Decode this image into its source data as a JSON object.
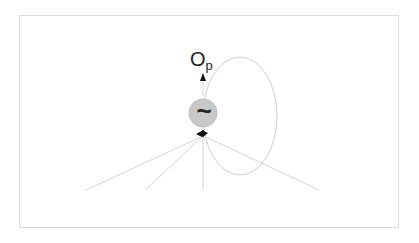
{
  "diagram": {
    "title": "",
    "output_label": "O",
    "output_subscript": "p",
    "node_symbol": "~",
    "node": {
      "cx": 203,
      "cy": 113,
      "r": 14,
      "fill": "#c8c8c8"
    },
    "output_arrow": {
      "x1": 203,
      "y1": 96,
      "x2": 203,
      "y2": 74
    },
    "feedback_loop": {
      "cx": 240,
      "cy": 116,
      "rx": 37,
      "ry": 59
    },
    "input_lines": [
      {
        "x1": 86,
        "y1": 190
      },
      {
        "x1": 145,
        "y1": 190
      },
      {
        "x1": 203,
        "y1": 190
      },
      {
        "x1": 319,
        "y1": 190
      }
    ],
    "line_color": "#cfcfcf",
    "arrow_color": "#111111"
  }
}
